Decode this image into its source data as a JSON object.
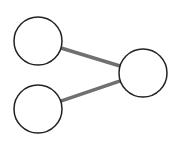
{
  "diagram": {
    "type": "graph",
    "width": 177,
    "height": 142,
    "background": "#ffffff",
    "node_fill": "#ffffff",
    "node_stroke": "#222222",
    "node_stroke_width": 1.5,
    "edge_color": "#707070",
    "edge_width": 3.5,
    "nodes": [
      {
        "id": "top-left",
        "cx": 38,
        "cy": 41,
        "r": 24,
        "label": ""
      },
      {
        "id": "bottom-left",
        "cx": 38,
        "cy": 109,
        "r": 24,
        "label": ""
      },
      {
        "id": "right",
        "cx": 143,
        "cy": 73,
        "r": 24,
        "label": ""
      }
    ],
    "edges": [
      {
        "from": "top-left",
        "to": "right"
      },
      {
        "from": "bottom-left",
        "to": "right"
      }
    ]
  }
}
